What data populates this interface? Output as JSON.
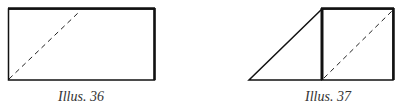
{
  "figures": [
    {
      "caption": "Illus. 36",
      "caption_x": 58,
      "caption_y": 89
    },
    {
      "caption": "Illus. 37",
      "caption_x": 305,
      "caption_y": 89
    }
  ],
  "colors": {
    "line": "#111111",
    "caption": "#333333"
  }
}
